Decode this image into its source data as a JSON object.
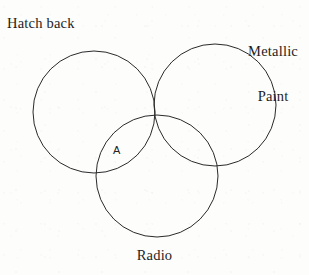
{
  "figure": {
    "type": "venn-diagram",
    "background_color": "#fdfdfc",
    "stroke_color": "#2a2a2a",
    "stroke_width": 1,
    "labels": {
      "set_left": "Hatch back",
      "set_right_line1": "Metallic",
      "set_right_line2": "Paint",
      "set_bottom": "Radio",
      "region_marker": "A"
    }
  },
  "chart_data": {
    "type": "venn",
    "title": "",
    "sets": [
      {
        "name": "Hatch back",
        "label_position": "top-left",
        "cx": 94,
        "cy": 112,
        "r": 61
      },
      {
        "name": "Metallic Paint",
        "label_position": "top-right",
        "cx": 215,
        "cy": 105,
        "r": 61
      },
      {
        "name": "Radio",
        "label_position": "bottom-center",
        "cx": 157,
        "cy": 176,
        "r": 61
      }
    ],
    "region_labels": [
      {
        "text": "A",
        "x": 118,
        "y": 150,
        "sets": [
          "Hatch back",
          "Radio"
        ]
      }
    ],
    "filled": false,
    "legend": "none"
  }
}
